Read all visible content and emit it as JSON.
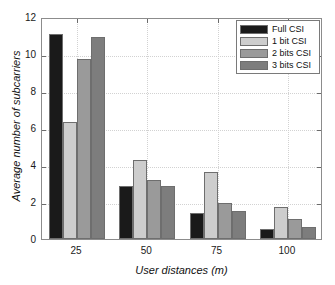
{
  "chart_data": {
    "type": "bar",
    "title": "",
    "xlabel": "User distances (m)",
    "ylabel": "Average number of subcarriers",
    "categories": [
      "25",
      "50",
      "75",
      "100"
    ],
    "ylim": [
      0,
      12
    ],
    "yticks": [
      0,
      2,
      4,
      6,
      8,
      10,
      12
    ],
    "ytick_labels": [
      "0",
      "2",
      "4",
      "6",
      "8",
      "10",
      "12"
    ],
    "grid": true,
    "legend_position": "top-right",
    "series": [
      {
        "name": "Full CSI",
        "color": "#1a1a1a",
        "values": [
          11.1,
          2.85,
          1.4,
          0.55
        ]
      },
      {
        "name": "1 bit CSI",
        "color": "#cdcdcd",
        "values": [
          6.35,
          4.25,
          3.6,
          1.75
        ]
      },
      {
        "name": "2 bits CSI",
        "color": "#9a9a9a",
        "values": [
          9.75,
          3.2,
          1.95,
          1.1
        ]
      },
      {
        "name": "3 bits CSI",
        "color": "#7d7d7d",
        "values": [
          10.9,
          2.85,
          1.5,
          0.65
        ]
      }
    ]
  },
  "legend": {
    "items": [
      {
        "label": "Full CSI"
      },
      {
        "label": "1 bit CSI"
      },
      {
        "label": "2 bits CSI"
      },
      {
        "label": "3 bits CSI"
      }
    ]
  }
}
